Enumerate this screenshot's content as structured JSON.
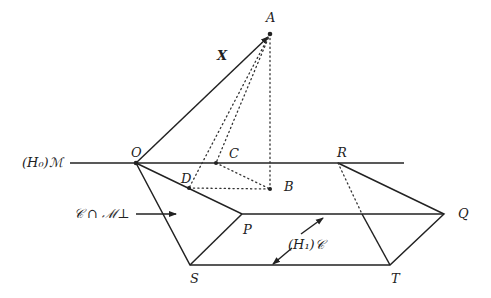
{
  "diagram": {
    "points": {
      "O": {
        "label": "O",
        "x": 136,
        "y": 163
      },
      "A": {
        "label": "A",
        "x": 270,
        "y": 34
      },
      "B": {
        "label": "B",
        "x": 270,
        "y": 189
      },
      "C": {
        "label": "C",
        "x": 216,
        "y": 163
      },
      "D": {
        "label": "D",
        "x": 189,
        "y": 188
      },
      "R": {
        "label": "R",
        "x": 338,
        "y": 163
      },
      "P": {
        "label": "P",
        "x": 242,
        "y": 214
      },
      "Q": {
        "label": "Q",
        "x": 444,
        "y": 214
      },
      "S": {
        "label": "S",
        "x": 190,
        "y": 265
      },
      "T": {
        "label": "T",
        "x": 390,
        "y": 265
      }
    },
    "labels": {
      "vector_x": "X",
      "h0_m": "(H₀)ℳ",
      "c_cap_m_perp": "𝒞 ∩ ℳ⊥",
      "h1_c": "(H₁)𝒞"
    },
    "colors": {
      "stroke": "#222222",
      "background": "#ffffff"
    }
  }
}
